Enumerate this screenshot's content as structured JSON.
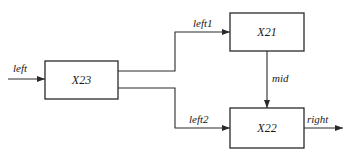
{
  "diagram": {
    "blocks": [
      {
        "id": "x23",
        "label": "X23"
      },
      {
        "id": "x21",
        "label": "X21"
      },
      {
        "id": "x22",
        "label": "X22"
      }
    ],
    "signals": {
      "input": "left",
      "branch_upper": "left1",
      "branch_lower": "left2",
      "internal": "mid",
      "output": "right"
    },
    "colors": {
      "line": "#2a2a2a",
      "background": "#ffffff"
    }
  }
}
